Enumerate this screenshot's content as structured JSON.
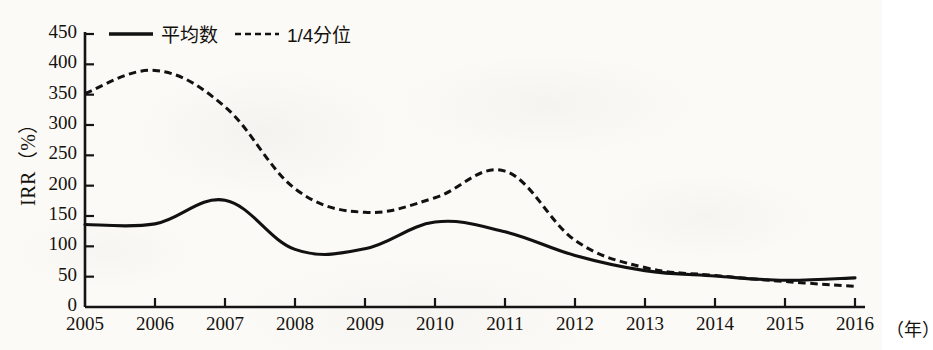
{
  "chart_data": {
    "type": "line",
    "title": "",
    "subtitle": "",
    "xlabel": "（年）",
    "ylabel": "IRR（%）",
    "x": [
      2005,
      2006,
      2007,
      2008,
      2009,
      2010,
      2011,
      2012,
      2013,
      2014,
      2015,
      2016
    ],
    "categories": [
      "2005",
      "2006",
      "2007",
      "2008",
      "2009",
      "2010",
      "2011",
      "2012",
      "2013",
      "2014",
      "2015",
      "2016"
    ],
    "xtick_labels": [
      "2005",
      "2006",
      "2007",
      "2008",
      "2009",
      "2010",
      "2011",
      "2012",
      "2013",
      "2014",
      "2015",
      "2016"
    ],
    "ytick_labels": [
      "0",
      "50",
      "100",
      "150",
      "200",
      "250",
      "300",
      "350",
      "400",
      "450"
    ],
    "yticks": [
      0,
      50,
      100,
      150,
      200,
      250,
      300,
      350,
      400,
      450
    ],
    "ylim": [
      0,
      450
    ],
    "xlim": [
      2005,
      2016
    ],
    "grid": false,
    "legend_position": "top-left",
    "series": [
      {
        "name": "平均数",
        "style": "solid",
        "color": "#111111",
        "values": [
          136,
          137,
          176,
          95,
          96,
          140,
          124,
          85,
          60,
          51,
          44,
          48
        ]
      },
      {
        "name": "1/4分位",
        "style": "dashed",
        "color": "#111111",
        "values": [
          352,
          390,
          330,
          195,
          156,
          180,
          224,
          110,
          65,
          52,
          42,
          34
        ]
      }
    ]
  },
  "legend": {
    "items": [
      {
        "label": "平均数",
        "style": "solid",
        "icon": "solid-line-swatch"
      },
      {
        "label": "1/4分位",
        "style": "dashed",
        "icon": "dashed-line-swatch"
      }
    ]
  },
  "axes": {
    "y_title": "IRR（%）",
    "x_unit": "（年）"
  }
}
